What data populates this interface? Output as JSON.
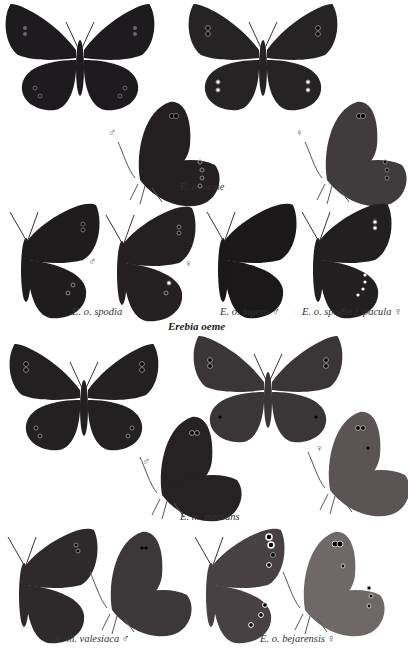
{
  "plate": {
    "species_title": "Erebia oeme",
    "colors": {
      "background": "#ffffff",
      "wing_dark": "#1c1a1c",
      "wing_mid": "#2f2c2e",
      "wing_grey": "#4a4647",
      "wing_light": "#6b6566",
      "band": "#5a5152",
      "eyespot_ring": "#8a8284",
      "caption_text": "#333333"
    },
    "sections": [
      {
        "caption": "E. o. oeme",
        "figures": [
          {
            "view": "upperside",
            "sex": "male"
          },
          {
            "view": "upperside",
            "sex": "female"
          },
          {
            "view": "underside",
            "sex": "male",
            "symbol": "♂"
          },
          {
            "view": "underside",
            "sex": "female",
            "symbol": "♀"
          }
        ]
      },
      {
        "figures": [
          {
            "view": "half-spread",
            "caption": "E. o. spodia",
            "sex_symbols": [
              "♂",
              "♀"
            ]
          },
          {
            "view": "half-spread",
            "caption": "E. o. lugens ♂"
          },
          {
            "view": "half-spread",
            "caption": "E. o. spodia f. pacula ♀"
          }
        ],
        "captions": [
          "E. o. spodia",
          "E. o. lugens ♂",
          "E. o. spodia f. pacula ♀"
        ]
      },
      {
        "caption": "E. m. meolans",
        "figures": [
          {
            "view": "upperside",
            "sex": "male"
          },
          {
            "view": "upperside",
            "sex": "female"
          },
          {
            "view": "underside",
            "sex": "male",
            "symbol": "♂"
          },
          {
            "view": "underside",
            "sex": "female",
            "symbol": "♀"
          }
        ]
      },
      {
        "captions": [
          "E. m. valesiaca ♂",
          "E. o. bejarensis ♀"
        ]
      }
    ],
    "labels": {
      "oeme": "E. o. oeme",
      "spodia": "E. o. spodia",
      "lugens": "E. o. lugens ♂",
      "pacula": "E. o. spodia f. pacula ♀",
      "meolans": "E. m. meolans",
      "valesiaca": "E. m. valesiaca ♂",
      "bejarensis": "E. o. bejarensis ♀",
      "male": "♂",
      "female": "♀"
    }
  }
}
